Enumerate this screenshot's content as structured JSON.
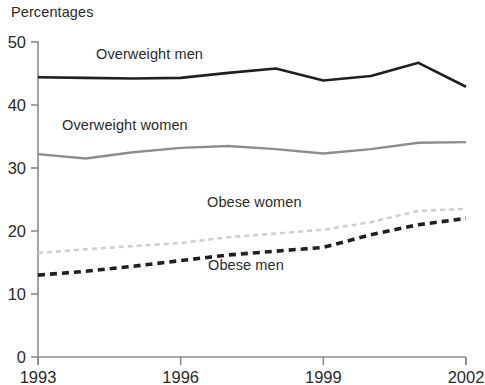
{
  "chart_data": {
    "type": "line",
    "title": "Percentages",
    "xlabel": "",
    "ylabel": "",
    "xlim": [
      1993,
      2002
    ],
    "ylim": [
      0,
      50
    ],
    "yticks": [
      0,
      10,
      20,
      30,
      40,
      50
    ],
    "ytick_labels": [
      "0",
      "10",
      "20",
      "30",
      "40",
      "50"
    ],
    "xticks": [
      1993,
      1996,
      1999,
      2002
    ],
    "xtick_labels": [
      "1993",
      "1996",
      "1999",
      "2002"
    ],
    "x": [
      1993,
      1994,
      1995,
      1996,
      1997,
      1998,
      1999,
      2000,
      2001,
      2002
    ],
    "grid": false,
    "legend": "inline-labels",
    "series": [
      {
        "name": "Overweight men",
        "label": "Overweight men",
        "color": "#231f20",
        "style": "solid",
        "width": 2.6,
        "values": [
          44.4,
          44.3,
          44.2,
          44.3,
          45.1,
          45.8,
          43.9,
          44.6,
          46.7,
          42.9
        ]
      },
      {
        "name": "Overweight women",
        "label": "Overweight women",
        "color": "#8d8d8d",
        "style": "solid",
        "width": 2.4,
        "values": [
          32.2,
          31.5,
          32.5,
          33.2,
          33.5,
          33.0,
          32.3,
          33.0,
          34.0,
          34.1
        ]
      },
      {
        "name": "Obese women",
        "label": "Obese women",
        "color": "#cfcfcf",
        "style": "dashed",
        "width": 2.6,
        "values": [
          16.5,
          17.1,
          17.6,
          18.1,
          19.0,
          19.6,
          20.2,
          21.4,
          23.2,
          23.5
        ]
      },
      {
        "name": "Obese men",
        "label": "Obese men",
        "color": "#231f20",
        "style": "dashed",
        "width": 3.6,
        "values": [
          13.0,
          13.6,
          14.4,
          15.3,
          16.2,
          16.8,
          17.4,
          19.4,
          21.0,
          22.0
        ]
      }
    ]
  },
  "axis": {
    "line_color": "#8d8d8d",
    "tick_color": "#8d8d8d"
  }
}
